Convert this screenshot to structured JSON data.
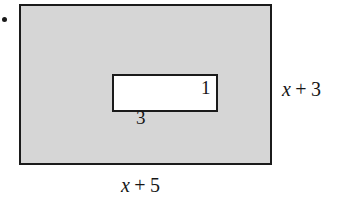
{
  "figure": {
    "type": "geometry-diagram",
    "colors": {
      "shaded_fill": "#d6d6d6",
      "cutout_fill": "#ffffff",
      "stroke": "#1b1b1b",
      "text": "#161616",
      "background": "#ffffff"
    },
    "bullet": "•"
  },
  "shapes": {
    "outer_rectangle": {
      "name": "outer-shaded-rectangle",
      "fill": "shaded",
      "width_label": {
        "variable": "x",
        "operator": "+",
        "constant": "5"
      },
      "height_label": {
        "variable": "x",
        "operator": "+",
        "constant": "3"
      }
    },
    "inner_rectangle": {
      "name": "inner-cutout-rectangle",
      "fill": "white",
      "width_label": "3",
      "height_label": "1"
    }
  },
  "labels": {
    "outer_width": {
      "var": "x",
      "op": "+",
      "num": "5"
    },
    "outer_height": {
      "var": "x",
      "op": "+",
      "num": "3"
    },
    "inner_width": "3",
    "inner_height": "1"
  }
}
